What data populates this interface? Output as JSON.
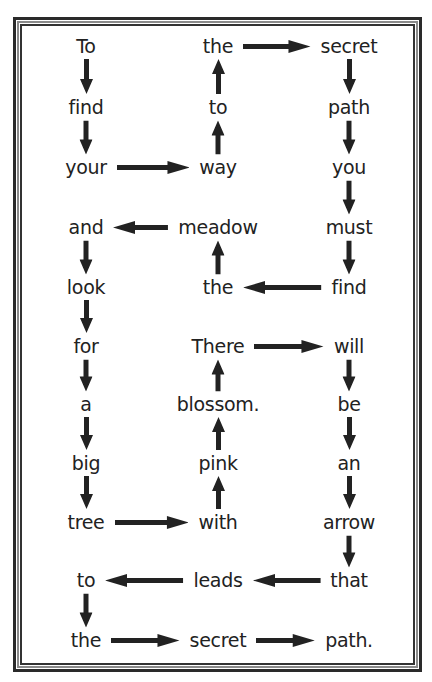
{
  "colors": {
    "ink": "#222222",
    "frame_dark": "#2a2a2a",
    "frame_mid": "#8a8a8a",
    "background": "#ffffff"
  },
  "layout": {
    "columns_x": [
      86,
      218,
      349
    ],
    "rows_y": [
      46,
      107,
      167,
      227,
      287,
      346,
      404,
      463,
      522,
      580,
      640
    ]
  },
  "puzzle": {
    "title": "",
    "sentence": "To find your way to the secret path you must find the meadow and look for a big tree with pink blossom. There will be an arrow that leads to the secret path.",
    "grid": [
      [
        "To",
        "the",
        "secret"
      ],
      [
        "find",
        "to",
        "path"
      ],
      [
        "your",
        "way",
        "you"
      ],
      [
        "and",
        "meadow",
        "must"
      ],
      [
        "look",
        "the",
        "find"
      ],
      [
        "for",
        "There",
        "will"
      ],
      [
        "a",
        "blossom.",
        "be"
      ],
      [
        "big",
        "pink",
        "an"
      ],
      [
        "tree",
        "with",
        "arrow"
      ],
      [
        "to",
        "leads",
        "that"
      ],
      [
        "the",
        "secret",
        "path."
      ]
    ],
    "arrows": [
      {
        "from": [
          0,
          0
        ],
        "to": [
          1,
          0
        ],
        "dir": "down"
      },
      {
        "from": [
          1,
          0
        ],
        "to": [
          2,
          0
        ],
        "dir": "down"
      },
      {
        "from": [
          2,
          0
        ],
        "to": [
          2,
          1
        ],
        "dir": "right"
      },
      {
        "from": [
          2,
          1
        ],
        "to": [
          1,
          1
        ],
        "dir": "up"
      },
      {
        "from": [
          1,
          1
        ],
        "to": [
          0,
          1
        ],
        "dir": "up"
      },
      {
        "from": [
          0,
          1
        ],
        "to": [
          0,
          2
        ],
        "dir": "right"
      },
      {
        "from": [
          0,
          2
        ],
        "to": [
          1,
          2
        ],
        "dir": "down"
      },
      {
        "from": [
          1,
          2
        ],
        "to": [
          2,
          2
        ],
        "dir": "down"
      },
      {
        "from": [
          2,
          2
        ],
        "to": [
          3,
          2
        ],
        "dir": "down"
      },
      {
        "from": [
          3,
          2
        ],
        "to": [
          4,
          2
        ],
        "dir": "down"
      },
      {
        "from": [
          4,
          2
        ],
        "to": [
          4,
          1
        ],
        "dir": "left"
      },
      {
        "from": [
          4,
          1
        ],
        "to": [
          3,
          1
        ],
        "dir": "up"
      },
      {
        "from": [
          3,
          1
        ],
        "to": [
          3,
          0
        ],
        "dir": "left"
      },
      {
        "from": [
          3,
          0
        ],
        "to": [
          4,
          0
        ],
        "dir": "down"
      },
      {
        "from": [
          4,
          0
        ],
        "to": [
          5,
          0
        ],
        "dir": "down"
      },
      {
        "from": [
          5,
          0
        ],
        "to": [
          6,
          0
        ],
        "dir": "down"
      },
      {
        "from": [
          6,
          0
        ],
        "to": [
          7,
          0
        ],
        "dir": "down"
      },
      {
        "from": [
          7,
          0
        ],
        "to": [
          8,
          0
        ],
        "dir": "down"
      },
      {
        "from": [
          8,
          0
        ],
        "to": [
          8,
          1
        ],
        "dir": "right"
      },
      {
        "from": [
          8,
          1
        ],
        "to": [
          7,
          1
        ],
        "dir": "up"
      },
      {
        "from": [
          7,
          1
        ],
        "to": [
          6,
          1
        ],
        "dir": "up"
      },
      {
        "from": [
          6,
          1
        ],
        "to": [
          5,
          1
        ],
        "dir": "up"
      },
      {
        "from": [
          5,
          1
        ],
        "to": [
          5,
          2
        ],
        "dir": "right"
      },
      {
        "from": [
          5,
          2
        ],
        "to": [
          6,
          2
        ],
        "dir": "down"
      },
      {
        "from": [
          6,
          2
        ],
        "to": [
          7,
          2
        ],
        "dir": "down"
      },
      {
        "from": [
          7,
          2
        ],
        "to": [
          8,
          2
        ],
        "dir": "down"
      },
      {
        "from": [
          8,
          2
        ],
        "to": [
          9,
          2
        ],
        "dir": "down"
      },
      {
        "from": [
          9,
          2
        ],
        "to": [
          9,
          1
        ],
        "dir": "left"
      },
      {
        "from": [
          9,
          1
        ],
        "to": [
          9,
          0
        ],
        "dir": "left"
      },
      {
        "from": [
          9,
          0
        ],
        "to": [
          10,
          0
        ],
        "dir": "down"
      },
      {
        "from": [
          10,
          0
        ],
        "to": [
          10,
          1
        ],
        "dir": "right"
      },
      {
        "from": [
          10,
          1
        ],
        "to": [
          10,
          2
        ],
        "dir": "right"
      }
    ],
    "arrow_icon": "arrow-icon"
  }
}
